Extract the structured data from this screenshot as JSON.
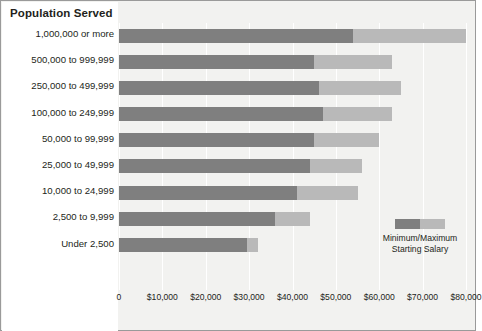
{
  "chart_title": "Population Served",
  "legend": {
    "line1": "Minimum/Maximum",
    "line2": "Starting Salary",
    "min_swatch_label": "minimum-swatch",
    "max_swatch_label": "maximum-swatch"
  },
  "colors": {
    "minimum": "#7f7f7f",
    "maximum": "#b9b9b9",
    "plot_background": "#f2f2f0",
    "gridline": "#ffffff",
    "text": "#231f20",
    "border": "#9a9a9a"
  },
  "chart_data": {
    "type": "bar",
    "orientation": "horizontal",
    "stacked": true,
    "title": "Population Served",
    "xlabel": "",
    "ylabel": "Population Served",
    "xlim": [
      0,
      80000
    ],
    "xticks": [
      0,
      10000,
      20000,
      30000,
      40000,
      50000,
      60000,
      70000,
      80000
    ],
    "xtick_labels": [
      "0",
      "$10,000",
      "$20,000",
      "$30,000",
      "$40,000",
      "$50,000",
      "$60,000",
      "$70,000",
      "$80,000"
    ],
    "grid": true,
    "legend_position": "right-inside",
    "categories": [
      "1,000,000 or more",
      "500,000 to 999,999",
      "250,000 to 499,999",
      "100,000 to 249,999",
      "50,000 to 99,999",
      "25,000 to 49,999",
      "10,000 to 24,999",
      "2,500 to 9,999",
      "Under 2,500"
    ],
    "series": [
      {
        "name": "Minimum Starting Salary",
        "values": [
          54000,
          45000,
          46000,
          47000,
          45000,
          44000,
          41000,
          36000,
          29500
        ]
      },
      {
        "name": "Maximum Starting Salary",
        "values": [
          80000,
          63000,
          65000,
          63000,
          60000,
          56000,
          55000,
          44000,
          32000
        ]
      }
    ]
  }
}
